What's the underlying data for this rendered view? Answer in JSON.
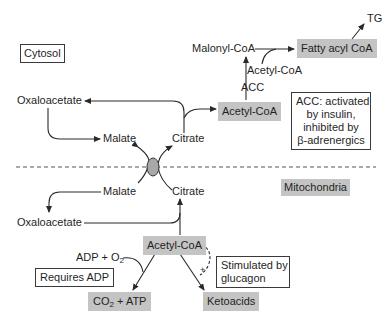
{
  "compartments": {
    "cytosol": "Cytosol",
    "mitochondria": "Mitochondria"
  },
  "cytosol_nodes": {
    "oxaloacetate": "Oxaloacetate",
    "malate": "Malate",
    "citrate": "Citrate",
    "acetyl_coa": "Acetyl-CoA",
    "acc_enzyme": "ACC",
    "malonyl_coa": "Malonyl-CoA",
    "acetyl_coa_input": "Acetyl-CoA",
    "fatty_acyl_coa": "Fatty acyl CoA",
    "tg": "TG"
  },
  "acc_note": {
    "line1": "ACC: activated",
    "line2": "by insulin,",
    "line3": "inhibited by",
    "line4": "β-adrenergics"
  },
  "mito_nodes": {
    "malate": "Malate",
    "citrate": "Citrate",
    "oxaloacetate": "Oxaloacetate",
    "acetyl_coa": "Acetyl-CoA",
    "adp_o2_main": "ADP + O",
    "adp_o2_sub": "2",
    "co2_atp_pre": "CO",
    "co2_atp_sub": "2",
    "co2_atp_post": " + ATP",
    "ketoacids": "Ketoacids",
    "plus_sign": "+"
  },
  "notes": {
    "requires_adp": "Requires ADP",
    "glucagon_line1": "Stimulated by",
    "glucagon_line2": "glucagon"
  },
  "colors": {
    "highlight_box": "#c4c4c4",
    "transporter": "#a8a8a8",
    "line": "#2a2a2a"
  }
}
